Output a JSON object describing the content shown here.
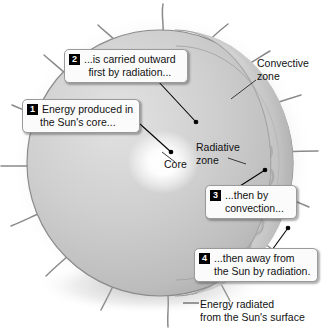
{
  "diagram": {
    "callouts": [
      {
        "number": "1",
        "name": "energy-produced-callout",
        "line1": "Energy produced in",
        "line2": "the Sun's core..."
      },
      {
        "number": "2",
        "name": "carried-outward-callout",
        "line1": "...is carried outward",
        "line2": "first by radiation..."
      },
      {
        "number": "3",
        "name": "convection-callout",
        "line1": "...then by",
        "line2": "convection..."
      },
      {
        "number": "4",
        "name": "away-by-radiation-callout",
        "line1": "...then away from",
        "line2": "the Sun by radiation."
      }
    ],
    "labels": {
      "convective_zone_line1": "Convective",
      "convective_zone_line2": "zone",
      "radiative_zone_line1": "Radiative",
      "radiative_zone_line2": "zone",
      "core": "Core",
      "bottom_caption_line1": "Energy radiated",
      "bottom_caption_line2": "from the Sun's surface"
    },
    "colors": {
      "background": "#ffffff",
      "sphere_light": "#d9d9d9",
      "sphere_mid": "#c2c2c2",
      "sphere_dark": "#9e9e9e",
      "cutaway_face": "#cfcfcf",
      "core_glow": "#ffffff",
      "convection_arc": "#8a8a8a",
      "outline": "#6e6e6e",
      "prominence": "#8c8c8c",
      "badge_background": "#000000",
      "badge_text": "#ffffff",
      "callout_background": "#fbfbfb",
      "callout_border": "#9a9a9a",
      "leader_line": "#000000",
      "text": "#111111"
    }
  }
}
